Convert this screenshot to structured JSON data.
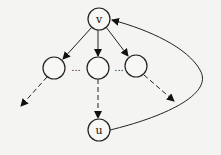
{
  "diagram": {
    "type": "tree-with-back-edge",
    "nodes": [
      {
        "id": "v",
        "label": "v",
        "x": 99,
        "y": 19
      },
      {
        "id": "c1",
        "label": "",
        "x": 54,
        "y": 68
      },
      {
        "id": "c2",
        "label": "",
        "x": 98,
        "y": 68
      },
      {
        "id": "c3",
        "label": "",
        "x": 136,
        "y": 66
      },
      {
        "id": "u",
        "label": "u",
        "x": 99,
        "y": 130
      }
    ],
    "ellipsis": [
      "...",
      "..."
    ],
    "edges": [
      {
        "from": "v",
        "to": "c1",
        "style": "solid"
      },
      {
        "from": "v",
        "to": "c2",
        "style": "solid"
      },
      {
        "from": "v",
        "to": "c3",
        "style": "solid"
      },
      {
        "from": "c1",
        "to": "offscreen-left",
        "style": "dashed"
      },
      {
        "from": "c2",
        "to": "u",
        "style": "dashed"
      },
      {
        "from": "c3",
        "to": "offscreen-right",
        "style": "dashed"
      },
      {
        "from": "u",
        "to": "v",
        "style": "solid-curved",
        "kind": "back-edge"
      }
    ]
  }
}
